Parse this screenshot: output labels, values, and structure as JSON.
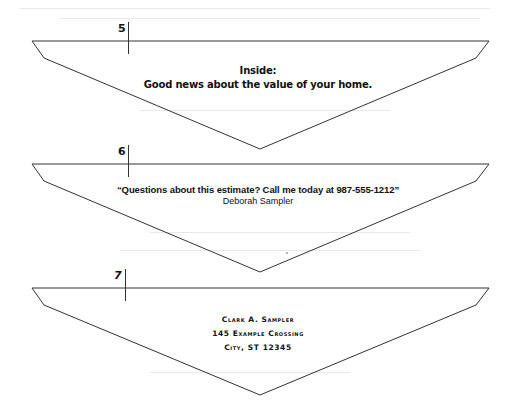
{
  "panels": [
    {
      "number": "5",
      "lines": [
        "Inside:",
        "Good news about the value of your home."
      ]
    },
    {
      "number": "6",
      "lines": [
        "“Questions about this estimate? Call me today at 987-555-1212”",
        "Deborah Sampler"
      ]
    },
    {
      "number": "7",
      "lines": [
        "Clark A. Sampler",
        "145 Example Crossing",
        "City, ST 12345"
      ]
    }
  ],
  "colors": {
    "line": "#333333",
    "text": "#111111",
    "background": "#ffffff"
  }
}
